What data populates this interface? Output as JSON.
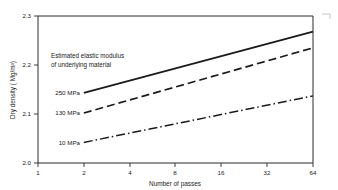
{
  "chart_data": {
    "type": "line",
    "title": "",
    "xlabel": "Number of passes",
    "ylabel": "Dry density ( Mg/m³)",
    "xscale": "log",
    "xlim": [
      1,
      64
    ],
    "ylim": [
      2.0,
      2.3
    ],
    "xticks": [
      1,
      2,
      4,
      8,
      16,
      32,
      64
    ],
    "xtick_labels": [
      "1",
      "2",
      "4",
      "8",
      "16",
      "32",
      "64"
    ],
    "yticks": [
      2.0,
      2.1,
      2.2,
      2.3
    ],
    "ytick_labels": [
      "2.0",
      "2.1",
      "2.2",
      "2.3"
    ],
    "grid": false,
    "legend": "inline-labels-left",
    "annotations": [
      {
        "name": "estimated-elastic-modulus-note",
        "line1": "Estimated elastic modulus",
        "line2": "of underlying material"
      }
    ],
    "x": [
      2,
      64
    ],
    "series": [
      {
        "name": "250 MPa",
        "label": "250 MPa",
        "style": "solid",
        "color": "#1a1a1a",
        "values": [
          2.143,
          2.268
        ]
      },
      {
        "name": "130 MPa",
        "label": "130 MPa",
        "style": "dashed",
        "color": "#1a1a1a",
        "values": [
          2.102,
          2.235
        ]
      },
      {
        "name": "10 MPa",
        "label": "10 MPa",
        "style": "dash-dot",
        "color": "#1a1a1a",
        "values": [
          2.042,
          2.137
        ]
      }
    ]
  },
  "axis": {
    "x_title": "Number of passes",
    "y_title": "Dry density ( Mg/m³)",
    "x_tick_1": "1",
    "x_tick_2": "2",
    "x_tick_3": "4",
    "x_tick_4": "8",
    "x_tick_5": "16",
    "x_tick_6": "32",
    "x_tick_7": "64",
    "y_tick_1": "2.0",
    "y_tick_2": "2.1",
    "y_tick_3": "2.2",
    "y_tick_4": "2.3"
  },
  "annotation": {
    "line1": "Estimated elastic modulus",
    "line2": "of underlying material"
  },
  "series_labels": {
    "s250": "250 MPa",
    "s130": "130 MPa",
    "s10": "10 MPa"
  }
}
